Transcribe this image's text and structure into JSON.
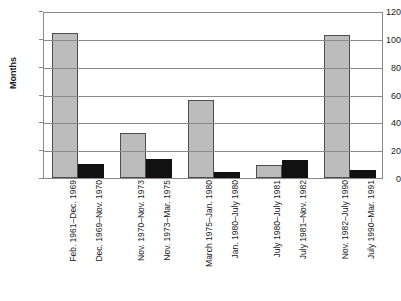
{
  "chart_data": {
    "type": "bar",
    "title": "",
    "xlabel": "",
    "ylabel": "Months",
    "ylim": [
      0,
      120
    ],
    "yticks": [
      0,
      20,
      40,
      60,
      80,
      100,
      120
    ],
    "ytick_labels": [
      "0",
      "20",
      "40",
      "60",
      "80",
      "100",
      "120"
    ],
    "grid": true,
    "legend": "none",
    "categories": [
      "Feb. 1961–Dec. 1969",
      "Dec. 1969–Nov. 1970",
      "Nov. 1970–Nov. 1973",
      "Nov. 1973–Mar. 1975",
      "March 1975–Jan. 1980",
      "Jan. 1980–July 1980",
      "July 1980–July 1981",
      "July 1981–Nov. 1982",
      "Nov. 1982–July 1990",
      "July 1990–Mar. 1991"
    ],
    "values": [
      104,
      10,
      32,
      14,
      56,
      4,
      9,
      13,
      103,
      6
    ],
    "bar_colors": [
      "#bcbcbc",
      "#111111",
      "#bcbcbc",
      "#111111",
      "#bcbcbc",
      "#111111",
      "#bcbcbc",
      "#111111",
      "#bcbcbc",
      "#111111"
    ],
    "colors": {
      "expansion": "#bcbcbc",
      "contraction": "#111111",
      "axis": "#8a8a8a",
      "text": "#1a1a1a",
      "background": "#ffffff"
    }
  }
}
